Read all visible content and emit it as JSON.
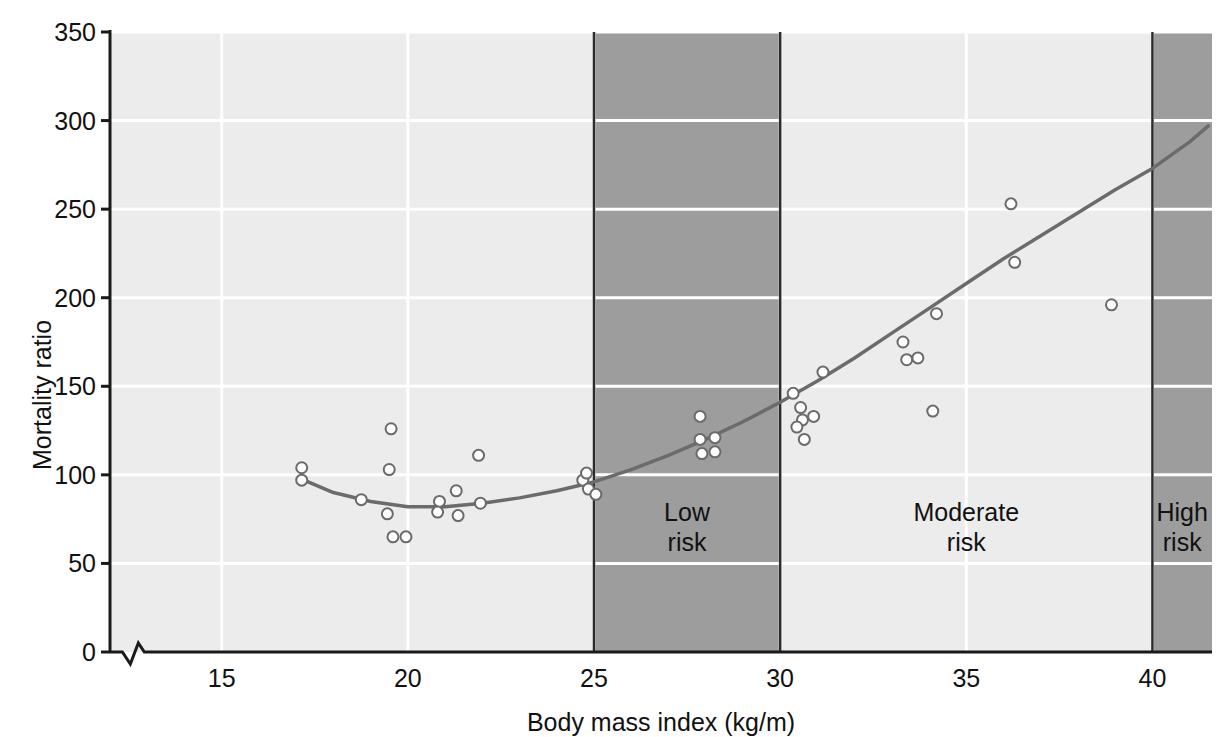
{
  "chart_data": {
    "type": "scatter",
    "title": "",
    "xlabel": "Body mass index (kg/m)",
    "ylabel": "Mortality ratio",
    "xlim": [
      12,
      41.6
    ],
    "ylim": [
      0,
      350
    ],
    "axis_break_x": 12.6,
    "grid": true,
    "gridcolor": "#ffffff",
    "legend": "none",
    "xticks": [
      15,
      20,
      25,
      30,
      35,
      40
    ],
    "yticks": [
      0,
      50,
      100,
      150,
      200,
      250,
      300,
      350
    ],
    "bands": [
      {
        "label": "Low\nrisk",
        "x0": 25,
        "x1": 30,
        "shade": "dark",
        "color": "#9d9d9d"
      },
      {
        "label": "Moderate\nrisk",
        "x0": 30,
        "x1": 40,
        "shade": "light",
        "color": "#ececec"
      },
      {
        "label": "High\nrisk",
        "x0": 40,
        "x1": 41.6,
        "shade": "dark",
        "color": "#9d9d9d"
      }
    ],
    "plot_background": "#ececec",
    "marker": {
      "shape": "circle",
      "facecolor": "#ffffff",
      "edgecolor": "#6b6b6b",
      "size": 11
    },
    "points": [
      {
        "x": 17.15,
        "y": 104
      },
      {
        "x": 17.15,
        "y": 97
      },
      {
        "x": 18.75,
        "y": 86
      },
      {
        "x": 19.55,
        "y": 126
      },
      {
        "x": 19.5,
        "y": 103
      },
      {
        "x": 19.45,
        "y": 78
      },
      {
        "x": 19.6,
        "y": 65
      },
      {
        "x": 19.95,
        "y": 65
      },
      {
        "x": 20.85,
        "y": 85
      },
      {
        "x": 20.8,
        "y": 79
      },
      {
        "x": 21.3,
        "y": 91
      },
      {
        "x": 21.35,
        "y": 77
      },
      {
        "x": 21.9,
        "y": 111
      },
      {
        "x": 21.95,
        "y": 84
      },
      {
        "x": 24.7,
        "y": 97
      },
      {
        "x": 24.8,
        "y": 101
      },
      {
        "x": 24.85,
        "y": 92
      },
      {
        "x": 25.05,
        "y": 89
      },
      {
        "x": 27.85,
        "y": 133
      },
      {
        "x": 27.85,
        "y": 120
      },
      {
        "x": 28.25,
        "y": 121
      },
      {
        "x": 27.9,
        "y": 112
      },
      {
        "x": 28.25,
        "y": 113
      },
      {
        "x": 30.35,
        "y": 146
      },
      {
        "x": 30.55,
        "y": 138
      },
      {
        "x": 30.6,
        "y": 131
      },
      {
        "x": 30.45,
        "y": 127
      },
      {
        "x": 30.9,
        "y": 133
      },
      {
        "x": 30.65,
        "y": 120
      },
      {
        "x": 31.15,
        "y": 158
      },
      {
        "x": 33.3,
        "y": 175
      },
      {
        "x": 33.4,
        "y": 165
      },
      {
        "x": 33.7,
        "y": 166
      },
      {
        "x": 34.2,
        "y": 191
      },
      {
        "x": 34.1,
        "y": 136
      },
      {
        "x": 36.2,
        "y": 253
      },
      {
        "x": 36.3,
        "y": 220
      },
      {
        "x": 38.9,
        "y": 196
      }
    ],
    "fit_curve": {
      "description": "U-shaped quadratic fit of mortality ratio versus body mass index",
      "color": "#6b6b6b",
      "linewidth": 3.5,
      "minimum": {
        "x": 20.5,
        "y": 82
      },
      "x": [
        17.1,
        18.0,
        19.0,
        20.0,
        20.5,
        21.0,
        22.0,
        23.0,
        24.0,
        25.0,
        26.0,
        27.0,
        28.0,
        29.0,
        30.0,
        31.0,
        32.0,
        33.0,
        34.0,
        35.0,
        36.0,
        37.0,
        38.0,
        39.0,
        40.0,
        41.0,
        41.5
      ],
      "y": [
        98,
        90,
        85,
        82,
        82,
        82,
        84,
        87,
        91,
        96,
        103,
        111,
        120,
        130,
        141,
        153,
        166,
        180,
        194,
        208,
        222,
        235,
        248,
        261,
        273,
        288,
        297
      ]
    }
  },
  "axis": {
    "y_label": "Mortality ratio",
    "x_label": "Body mass index (kg/m)",
    "y_tick_labels": [
      "350",
      "300",
      "250",
      "200",
      "150",
      "100",
      "50",
      "0"
    ],
    "x_tick_labels": [
      "15",
      "20",
      "25",
      "30",
      "35",
      "40"
    ]
  },
  "bands": {
    "low": {
      "line1": "Low",
      "line2": "risk"
    },
    "moderate": {
      "line1": "Moderate",
      "line2": "risk"
    },
    "high": {
      "line1": "High",
      "line2": "risk"
    }
  }
}
